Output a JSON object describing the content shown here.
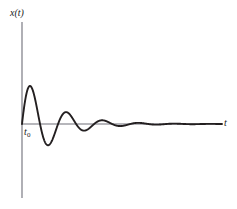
{
  "figure": {
    "background_color": "#ffffff",
    "curve_color": "#231f20",
    "axis_color": "#6e6e78",
    "ylabel": "x(t)",
    "xlabel": "t",
    "start_marker_label": "t",
    "start_marker_subscript": "0"
  },
  "chart_data": {
    "type": "line",
    "title": "",
    "subtitle": "",
    "xlabel": "t",
    "ylabel": "x(t)",
    "legend": [],
    "grid": false,
    "annotations": [
      {
        "text": "t0",
        "x": 0,
        "y": 0,
        "note": "start time marker at origin on t-axis"
      }
    ],
    "xlim": [
      0,
      10.4
    ],
    "ylim": [
      -1.05,
      1.05
    ],
    "model": {
      "amplitude": 1.0,
      "decay_rate": 0.62,
      "angular_frequency": 3.35,
      "phase": 0.0
    },
    "extrema": [
      {
        "index": 1,
        "kind": "peak",
        "x": 0.42,
        "y": 0.78
      },
      {
        "index": 1,
        "kind": "trough",
        "x": 1.36,
        "y": -0.44
      },
      {
        "index": 2,
        "kind": "peak",
        "x": 2.3,
        "y": 0.24
      },
      {
        "index": 2,
        "kind": "trough",
        "x": 3.23,
        "y": -0.14
      },
      {
        "index": 3,
        "kind": "peak",
        "x": 4.17,
        "y": 0.085
      },
      {
        "index": 3,
        "kind": "trough",
        "x": 5.1,
        "y": -0.05
      },
      {
        "index": 4,
        "kind": "peak",
        "x": 6.04,
        "y": 0.03
      },
      {
        "index": 4,
        "kind": "trough",
        "x": 6.98,
        "y": -0.018
      },
      {
        "index": 5,
        "kind": "peak",
        "x": 7.91,
        "y": 0.011
      },
      {
        "index": 5,
        "kind": "trough",
        "x": 8.85,
        "y": -0.006
      }
    ],
    "zero_crossings": [
      0,
      0.94,
      1.88,
      2.81,
      3.75,
      4.69,
      5.62,
      6.56,
      7.5,
      8.43,
      9.37
    ],
    "x": [
      0,
      0.2,
      0.4,
      0.6,
      0.8,
      1.0,
      1.2,
      1.4,
      1.6,
      1.8,
      2.0,
      2.2,
      2.4,
      2.6,
      2.8,
      3.0,
      3.2,
      3.4,
      3.6,
      3.8,
      4.0,
      4.2,
      4.4,
      4.6,
      4.8,
      5.0,
      5.2,
      5.4,
      5.6,
      5.8,
      6.0,
      6.2,
      6.4,
      6.6,
      6.8,
      7.0,
      7.2,
      7.4,
      7.6,
      7.8,
      8.0,
      8.2,
      8.4,
      8.6,
      8.8,
      9.0,
      9.2,
      9.4,
      9.6,
      9.8,
      10.0,
      10.2,
      10.4
    ],
    "y": [
      0,
      0.54,
      0.78,
      0.72,
      0.44,
      0.1,
      -0.2,
      -0.4,
      -0.44,
      -0.35,
      -0.17,
      0.02,
      0.18,
      0.24,
      0.23,
      0.15,
      0.04,
      -0.06,
      -0.13,
      -0.14,
      -0.11,
      -0.05,
      0.01,
      0.06,
      0.085,
      0.08,
      0.05,
      0.01,
      -0.02,
      -0.045,
      -0.05,
      -0.04,
      -0.02,
      0.0,
      0.018,
      0.028,
      0.03,
      0.022,
      0.01,
      0.0,
      -0.008,
      -0.015,
      -0.017,
      -0.013,
      -0.006,
      0.0,
      0.005,
      0.009,
      0.01,
      0.007,
      0.003,
      -0.001,
      -0.004
    ]
  }
}
